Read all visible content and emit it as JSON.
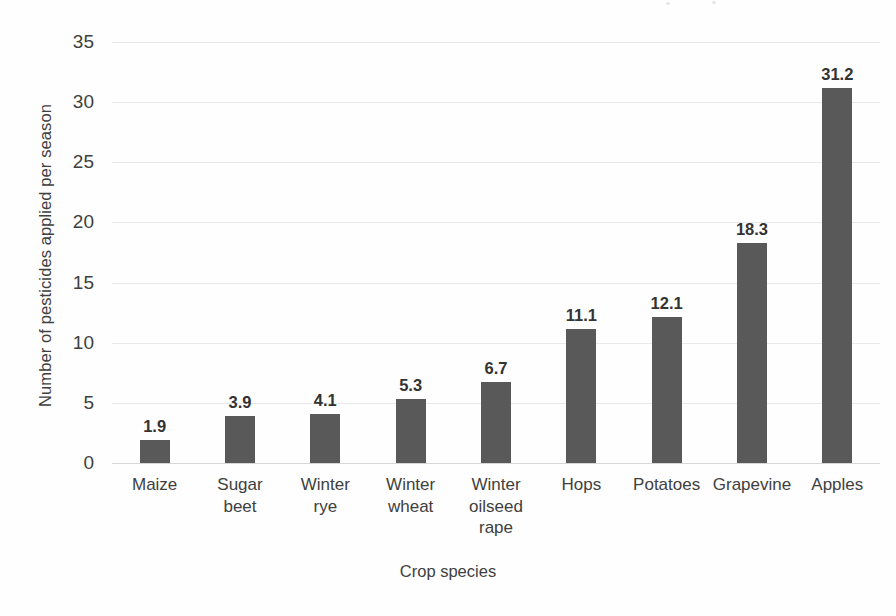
{
  "chart_data": {
    "type": "bar",
    "title": "",
    "xlabel": "Crop species",
    "ylabel": "Number of pesticides applied per season",
    "categories": [
      "Maize",
      "Sugar beet",
      "Winter rye",
      "Winter wheat",
      "Winter oilseed rape",
      "Hops",
      "Potatoes",
      "Grapevine",
      "Apples"
    ],
    "values": [
      1.9,
      3.9,
      4.1,
      5.3,
      6.7,
      11.1,
      12.1,
      18.3,
      31.2
    ],
    "data_labels": [
      "1.9",
      "3.9",
      "4.1",
      "5.3",
      "6.7",
      "11.1",
      "12.1",
      "18.3",
      "31.2"
    ],
    "ylim": [
      0,
      35
    ],
    "yticks": [
      0,
      5,
      10,
      15,
      20,
      25,
      30,
      35
    ],
    "ytick_labels": [
      "0",
      "5",
      "10",
      "15",
      "20",
      "25",
      "30",
      "35"
    ],
    "grid": true,
    "legend": null,
    "bar_color": "#595959",
    "gridline_color": "#e9e9e9",
    "text_color": "#404040",
    "background_color": "#ffffff"
  },
  "axis": {
    "y_title": "Number of pesticides applied per season",
    "x_title": "Crop species"
  },
  "category_lines": [
    [
      "Maize"
    ],
    [
      "Sugar",
      "beet"
    ],
    [
      "Winter",
      "rye"
    ],
    [
      "Winter",
      "wheat"
    ],
    [
      "Winter",
      "oilseed",
      "rape"
    ],
    [
      "Hops"
    ],
    [
      "Potatoes"
    ],
    [
      "Grapevine"
    ],
    [
      "Apples"
    ]
  ]
}
